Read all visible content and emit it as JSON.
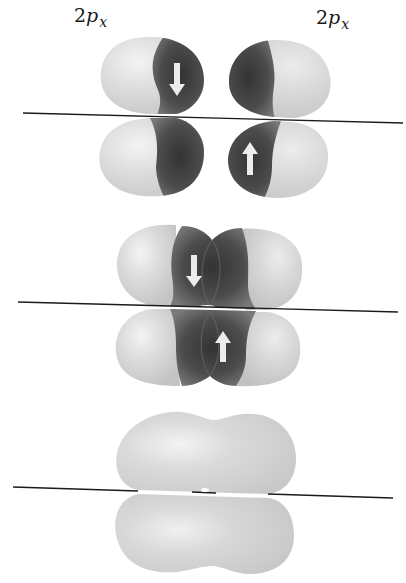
{
  "figure": {
    "labels": [
      {
        "id": "left",
        "main": "2",
        "orbital": "p",
        "subscript": "x"
      },
      {
        "id": "right",
        "main": "2",
        "orbital": "p",
        "subscript": "x"
      }
    ],
    "stages": [
      {
        "name": "separate-orbitals",
        "description": "Two separate 2p_x orbitals, each with one electron (spin down on left, spin up on right)",
        "arrows": [
          "down",
          "up"
        ]
      },
      {
        "name": "overlapping-orbitals",
        "description": "Side-by-side overlap of the two 2p_x orbitals with paired electrons",
        "arrows": [
          "down",
          "up"
        ]
      },
      {
        "name": "pi-bond",
        "description": "Resulting pi molecular orbital above and below the internuclear axis",
        "arrows": []
      }
    ],
    "colors": {
      "light_lobe": "#d6d6d6",
      "light_highlight": "#f2f2f2",
      "dark_lobe": "#5a5a5a",
      "dark_core": "#3a3a3a",
      "axis": "#1a1a1a",
      "arrow": "#eeeeee",
      "pi_lobe": "#d8d8d8"
    }
  }
}
